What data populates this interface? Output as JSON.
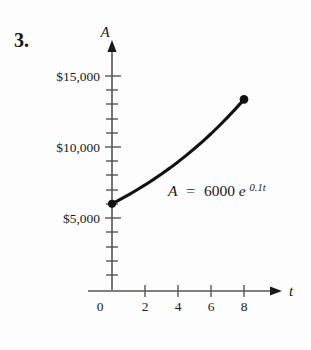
{
  "figure": {
    "problem_number": "3.",
    "equation": {
      "lhs": "A",
      "equals": "=",
      "coefficient": "6000",
      "base": "e",
      "exponent": "0.1t",
      "full": "A = 6000e^{0.1t}"
    }
  },
  "chart_data": {
    "type": "line",
    "title": "",
    "subtitle": "",
    "xlabel": "t",
    "ylabel": "A",
    "xlim": [
      0,
      9.5
    ],
    "ylim": [
      0,
      16800
    ],
    "grid": false,
    "legend": null,
    "x_tick_labels": [
      "0",
      "2",
      "4",
      "6",
      "8"
    ],
    "x_tick_values": [
      0,
      2,
      4,
      6,
      8
    ],
    "x_minor_tick_values": [
      1,
      3,
      5,
      7
    ],
    "y_tick_labels": [
      "$5,000",
      "$10,000",
      "$15,000"
    ],
    "y_tick_values": [
      5000,
      10000,
      15000
    ],
    "y_minor_tick_values": [
      1000,
      2000,
      3000,
      4000,
      6000,
      7000,
      8000,
      9000,
      11000,
      12000,
      13000,
      14000,
      16000
    ],
    "annotation": "A = 6000e^{0.1t}",
    "series": [
      {
        "name": "A = 6000e^{0.1t}",
        "x": [
          0,
          0.5,
          1,
          1.5,
          2,
          2.5,
          3,
          3.5,
          4,
          4.5,
          5,
          5.5,
          6,
          6.5,
          7,
          7.5,
          8
        ],
        "values": [
          6000,
          6308,
          6631,
          6971,
          7328,
          7704,
          8098,
          8513,
          8951,
          9410,
          9892,
          10401,
          10933,
          11496,
          12083,
          12706,
          13354
        ]
      }
    ],
    "endpoints": [
      {
        "label": "start",
        "x": 0,
        "y": 6000
      },
      {
        "label": "end",
        "x": 8,
        "y": 13354
      }
    ],
    "axis_arrows": {
      "x": true,
      "y": true
    },
    "line_color": "#111111",
    "axis_color": "#555555"
  }
}
